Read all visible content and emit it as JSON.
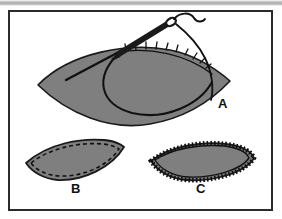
{
  "figure": {
    "panels": [
      {
        "id": "A",
        "label": "A",
        "description": "Lens-shaped fabric piece with threaded needle inserted along the upper seam, basting stitches and thread loop visible",
        "label_x": 218,
        "label_y": 108
      },
      {
        "id": "B",
        "label": "B",
        "description": "Lens-shaped fabric piece finished with a dashed running stitch inside the edge",
        "label_x": 71,
        "label_y": 193
      },
      {
        "id": "C",
        "label": "C",
        "description": "Lens-shaped fabric piece finished with a dense overcast whip stitch around the edge",
        "label_x": 196,
        "label_y": 193
      }
    ],
    "colors": {
      "fabric_fill": "#7f7f7f",
      "outline": "#1a1a1a",
      "stitch": "#111111",
      "frame": "#2b2b2b",
      "background": "#ffffff",
      "scan_bar": "#a9a9a9"
    },
    "frame": {
      "x": 8,
      "y": 10,
      "width": 265,
      "height": 201
    }
  }
}
